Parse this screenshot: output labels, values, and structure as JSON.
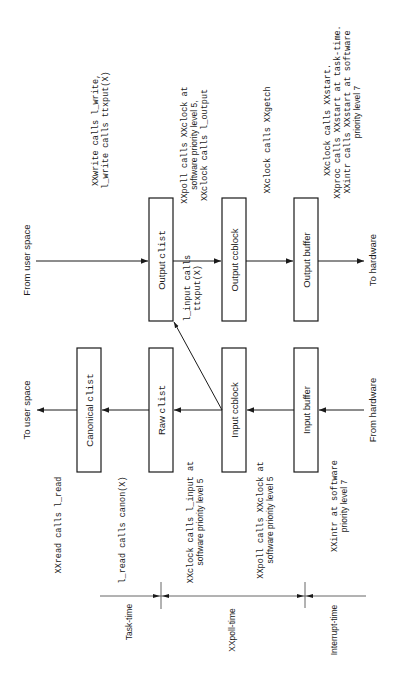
{
  "diagram": {
    "orientation": "rotated 90deg counter-clockwise",
    "output_path": {
      "source_label": "From user space",
      "sink_label": "To hardware",
      "boxes": [
        {
          "prefix": "Output ",
          "code": "clist"
        },
        {
          "prefix": "Output ccblock",
          "code": ""
        },
        {
          "prefix": "Output buffer",
          "code": ""
        }
      ]
    },
    "input_path": {
      "source_label": "From hardware",
      "sink_label": "To user space",
      "boxes": [
        {
          "prefix": "Canonical ",
          "code": "clist"
        },
        {
          "prefix": "Raw ",
          "code": "clist"
        },
        {
          "prefix": "Input ccblock",
          "code": ""
        },
        {
          "prefix": "Input buffer",
          "code": ""
        }
      ]
    },
    "echo_label": {
      "line1": "l_input calls",
      "line2": "ttxput(X)"
    },
    "output_annotations": {
      "write": {
        "line1": "XXwrite calls l_write,",
        "line2": "l_write calls ttxput(X)"
      },
      "poll": {
        "line1": "XXpoll calls XXclock at",
        "line2": "software priority level 5,",
        "line3": "XXclock calls l_output"
      },
      "getch": {
        "line1": "XXclock calls XXgetch"
      },
      "start": {
        "line1": "XXclock calls XXstart.",
        "line2": "XXproc calls XXstart at task-time.",
        "line3": "XXintr calls XXstart at software",
        "line4": "priority level 7"
      }
    },
    "input_annotations": {
      "read": {
        "line1": "XXread calls l_read"
      },
      "canon": {
        "line1": "l_read calls canon(X)"
      },
      "clock_input": {
        "line1": "XXclock calls l_input at",
        "line2": "software priority level 5"
      },
      "poll_clock": {
        "line1": "XXpoll calls XXclock at",
        "line2": "software priority level 5"
      },
      "intr": {
        "line1": "XXintr at software",
        "line2": "priority level 7"
      }
    },
    "time_axis": {
      "segments": [
        {
          "label": "Task-time"
        },
        {
          "label": "XXpoll-time"
        },
        {
          "label": "Interrupt-time"
        }
      ]
    },
    "colors": {
      "ink": "#1a1a1a",
      "background": "#ffffff",
      "axis": "#555555"
    }
  }
}
